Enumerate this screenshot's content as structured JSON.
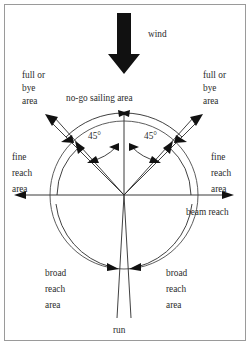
{
  "diagram": {
    "type": "sailing-points-of-sail",
    "background_color": "#ffffff",
    "line_color": "#2b2b2b",
    "text_color": "#2b2b2b",
    "frame_color": "#9a9a9a",
    "wind_arrow_color": "#111111"
  },
  "labels": {
    "wind": "wind",
    "no_go": "no-go sailing area",
    "full_or_bye_left_l1": "full or",
    "full_or_bye_left_l2": "bye",
    "full_or_bye_left_l3": "area",
    "full_or_bye_right_l1": "full or",
    "full_or_bye_right_l2": "bye",
    "full_or_bye_right_l3": "area",
    "fine_reach_left_l1": "fine",
    "fine_reach_left_l2": "reach",
    "fine_reach_left_l3": "area",
    "fine_reach_right_l1": "fine",
    "fine_reach_right_l2": "reach",
    "fine_reach_right_l3": "area",
    "beam_reach": "beam reach",
    "broad_reach_left_l1": "broad",
    "broad_reach_left_l2": "reach",
    "broad_reach_left_l3": "area",
    "broad_reach_right_l1": "broad",
    "broad_reach_right_l2": "reach",
    "broad_reach_right_l3": "area",
    "run": "run",
    "angle_left": "45°",
    "angle_right": "45°"
  },
  "geometry": {
    "center_x": 124,
    "center_y": 195,
    "circle_radius": 74,
    "no_go_half_angle_deg": 45,
    "run_half_angle_deg": 3
  }
}
